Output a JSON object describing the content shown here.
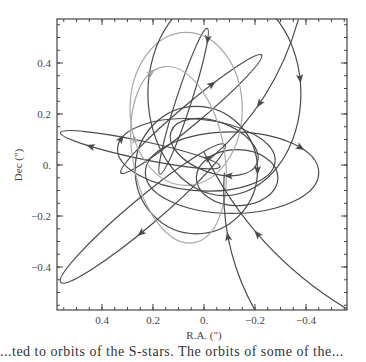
{
  "chart_data": {
    "type": "line",
    "title": "",
    "xlabel": "R.A. (\")",
    "ylabel": "Dec (\")",
    "xlim": [
      0.57,
      -0.57
    ],
    "ylim": [
      -0.57,
      0.57
    ],
    "x_reversed": true,
    "xticks": [
      0.4,
      0.2,
      0.0,
      -0.2,
      -0.4
    ],
    "xtick_labels": [
      "0.4",
      "0.2",
      "0.",
      "−0.2",
      "−0.4"
    ],
    "yticks": [
      0.4,
      0.2,
      0.0,
      -0.2,
      -0.4
    ],
    "ytick_labels": [
      "0.4",
      "0.2",
      "0.",
      "−0.2",
      "−0.4"
    ],
    "grid": false,
    "legend": null,
    "series": [
      {
        "name": "orbit-1",
        "shade": "dark",
        "type": "ellipse",
        "cx": 0.03,
        "cy": -0.02,
        "rx": 0.24,
        "ry": 0.25,
        "rotation": 0
      },
      {
        "name": "orbit-2",
        "shade": "dark",
        "type": "ellipse",
        "cx": 0.24,
        "cy": -0.19,
        "rx": 0.42,
        "ry": 0.055,
        "rotation": -40
      },
      {
        "name": "orbit-3",
        "shade": "dark",
        "type": "ellipse",
        "cx": 0.03,
        "cy": 0.04,
        "rx": 0.31,
        "ry": 0.14,
        "rotation": 5
      },
      {
        "name": "orbit-4",
        "shade": "dark",
        "type": "ellipse",
        "cx": 0.05,
        "cy": 0.2,
        "rx": 0.36,
        "ry": 0.04,
        "rotation": -40
      },
      {
        "name": "orbit-5",
        "shade": "dark",
        "type": "ellipse",
        "cx": 0.08,
        "cy": 0.25,
        "rx": 0.3,
        "ry": 0.03,
        "rotation": -72
      },
      {
        "name": "orbit-6",
        "shade": "dark",
        "type": "ellipse",
        "cx": 0.25,
        "cy": 0.06,
        "rx": 0.32,
        "ry": 0.035,
        "rotation": 12
      },
      {
        "name": "orbit-7",
        "shade": "dark",
        "type": "ellipse",
        "cx": -0.13,
        "cy": -0.05,
        "rx": 0.16,
        "ry": 0.11,
        "rotation": 0
      },
      {
        "name": "orbit-8",
        "shade": "dark",
        "type": "ellipse",
        "cx": -0.11,
        "cy": -0.03,
        "rx": 0.34,
        "ry": 0.16,
        "rotation": 0
      },
      {
        "name": "orbit-9",
        "shade": "dark",
        "type": "ellipse",
        "cx": -0.04,
        "cy": 0.07,
        "rx": 0.18,
        "ry": 0.1,
        "rotation": 20
      },
      {
        "name": "orbit-10",
        "shade": "light",
        "type": "ellipse",
        "cx": 0.07,
        "cy": 0.22,
        "rx": 0.22,
        "ry": 0.3,
        "rotation": 0
      },
      {
        "name": "orbit-11",
        "shade": "light",
        "type": "ellipse",
        "cx": 0.1,
        "cy": 0.04,
        "rx": 0.18,
        "ry": 0.35,
        "rotation": -10
      },
      {
        "name": "orbit-12",
        "shade": "dark",
        "type": "ellipse",
        "cx": -0.08,
        "cy": 0.28,
        "rx": 0.3,
        "ry": 0.4,
        "rotation": 0
      },
      {
        "name": "orbit-13",
        "shade": "dark",
        "type": "arc",
        "from": [
          -0.2,
          -0.57
        ],
        "to": [
          -0.08,
          -0.03
        ]
      },
      {
        "name": "orbit-14",
        "shade": "dark",
        "type": "arc",
        "from": [
          -0.57,
          -0.57
        ],
        "to": [
          0.0,
          0.05
        ]
      },
      {
        "name": "orbit-15",
        "shade": "dark",
        "type": "arc",
        "from": [
          -0.37,
          0.57
        ],
        "to": [
          -0.02,
          0.02
        ]
      }
    ]
  },
  "caption": "...ted to orbits of the S-stars. The orbits of some of the..."
}
